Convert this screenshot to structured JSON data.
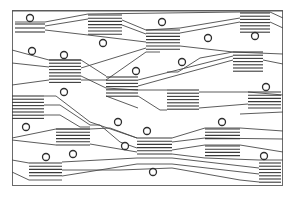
{
  "diagram": {
    "title": "",
    "frame": {
      "x": 12,
      "y": 10,
      "width": 271,
      "height": 176
    },
    "colors": {
      "line": "#4a4a4a",
      "frame": "#6a6a6a",
      "background": "#ffffff"
    },
    "bundles": [
      {
        "x": 15,
        "y": 24,
        "width": 30,
        "lines": 3,
        "spacing": 4
      },
      {
        "x": 88,
        "y": 15,
        "width": 34,
        "lines": 7,
        "spacing": 3.2
      },
      {
        "x": 146,
        "y": 30,
        "width": 34,
        "lines": 7,
        "spacing": 3.2
      },
      {
        "x": 240,
        "y": 13,
        "width": 30,
        "lines": 7,
        "spacing": 3.2
      },
      {
        "x": 49,
        "y": 60,
        "width": 32,
        "lines": 8,
        "spacing": 3.2
      },
      {
        "x": 106,
        "y": 77,
        "width": 32,
        "lines": 7,
        "spacing": 3.2
      },
      {
        "x": 167,
        "y": 90,
        "width": 32,
        "lines": 7,
        "spacing": 3.2
      },
      {
        "x": 233,
        "y": 52,
        "width": 30,
        "lines": 7,
        "spacing": 3.2
      },
      {
        "x": 12,
        "y": 96,
        "width": 32,
        "lines": 8,
        "spacing": 3.2
      },
      {
        "x": 248,
        "y": 92,
        "width": 33,
        "lines": 6,
        "spacing": 3.2
      },
      {
        "x": 56,
        "y": 129,
        "width": 34,
        "lines": 6,
        "spacing": 3.2
      },
      {
        "x": 137,
        "y": 138,
        "width": 35,
        "lines": 6,
        "spacing": 3.2
      },
      {
        "x": 205,
        "y": 129,
        "width": 35,
        "lines": 4,
        "spacing": 3.2
      },
      {
        "x": 205,
        "y": 146,
        "width": 35,
        "lines": 4,
        "spacing": 3.2
      },
      {
        "x": 29,
        "y": 163,
        "width": 33,
        "lines": 5,
        "spacing": 3.2
      },
      {
        "x": 259,
        "y": 163,
        "width": 22,
        "lines": 7,
        "spacing": 3.2
      }
    ],
    "nodes": [
      {
        "cx": 30,
        "cy": 18,
        "r": 3.5
      },
      {
        "cx": 162,
        "cy": 22,
        "r": 3.5
      },
      {
        "cx": 103,
        "cy": 43,
        "r": 3.5
      },
      {
        "cx": 208,
        "cy": 38,
        "r": 3.5
      },
      {
        "cx": 255,
        "cy": 36,
        "r": 3.5
      },
      {
        "cx": 32,
        "cy": 51,
        "r": 3.5
      },
      {
        "cx": 64,
        "cy": 55,
        "r": 3.5
      },
      {
        "cx": 182,
        "cy": 62,
        "r": 3.5
      },
      {
        "cx": 136,
        "cy": 71,
        "r": 3.5
      },
      {
        "cx": 64,
        "cy": 92,
        "r": 3.5
      },
      {
        "cx": 266,
        "cy": 87,
        "r": 3.5
      },
      {
        "cx": 118,
        "cy": 122,
        "r": 3.5
      },
      {
        "cx": 222,
        "cy": 122,
        "r": 3.5
      },
      {
        "cx": 26,
        "cy": 127,
        "r": 3.5
      },
      {
        "cx": 147,
        "cy": 131,
        "r": 3.5
      },
      {
        "cx": 125,
        "cy": 146,
        "r": 3.5
      },
      {
        "cx": 46,
        "cy": 157,
        "r": 3.5
      },
      {
        "cx": 73,
        "cy": 154,
        "r": 3.5
      },
      {
        "cx": 264,
        "cy": 156,
        "r": 3.5
      },
      {
        "cx": 153,
        "cy": 172,
        "r": 3.5
      }
    ]
  }
}
